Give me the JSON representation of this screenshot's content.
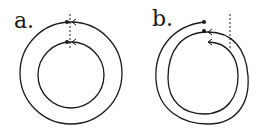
{
  "figure": {
    "panels": [
      {
        "label": "a.",
        "description": "Two concentric closed circles with start points aligned on a dashed vertical line"
      },
      {
        "label": "b.",
        "description": "Spiral path forming a double loop with start and end points on a dashed vertical line"
      }
    ],
    "colors": {
      "stroke": "#1a1a1a",
      "background": "#ffffff"
    }
  }
}
